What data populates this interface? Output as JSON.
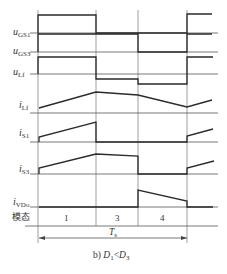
{
  "chart_data": {
    "type": "timing-diagram",
    "title": "",
    "caption": {
      "prefix": "b) ",
      "lhs": "D",
      "lhs_sub": "1",
      "op": "<",
      "rhs": "D",
      "rhs_sub": "3"
    },
    "period_label": {
      "main": "T",
      "sub": "s"
    },
    "mode_row": {
      "label": "模态",
      "modes": [
        "1",
        "3",
        "4"
      ]
    },
    "time_marks_px": [
      38,
      96,
      138,
      187
    ],
    "signals": [
      {
        "name": "u",
        "sub": "GS1",
        "baseline_y": 33,
        "label_y": 27,
        "points": [
          [
            38,
            33
          ],
          [
            38,
            15
          ],
          [
            96,
            15
          ],
          [
            96,
            33
          ],
          [
            187,
            33
          ],
          [
            187,
            14
          ],
          [
            212,
            14
          ]
        ]
      },
      {
        "name": "u",
        "sub": "GS3",
        "baseline_y": 52,
        "label_y": 46,
        "points": [
          [
            38,
            52
          ],
          [
            38,
            34
          ],
          [
            138,
            34
          ],
          [
            138,
            52
          ],
          [
            187,
            52
          ],
          [
            187,
            34
          ],
          [
            212,
            34
          ]
        ]
      },
      {
        "name": "u",
        "sub": "Lf",
        "baseline_y": 74,
        "label_y": 67,
        "points": [
          [
            38,
            74
          ],
          [
            38,
            57
          ],
          [
            96,
            57
          ],
          [
            96,
            79
          ],
          [
            138,
            79
          ],
          [
            138,
            84
          ],
          [
            187,
            84
          ],
          [
            187,
            57
          ],
          [
            213,
            57
          ]
        ]
      },
      {
        "name": "i",
        "sub": "Lf",
        "baseline_y": 113,
        "label_y": 100,
        "points": [
          [
            39,
            108
          ],
          [
            96,
            92
          ],
          [
            138,
            95
          ],
          [
            187,
            107
          ],
          [
            212,
            100
          ]
        ]
      },
      {
        "name": "i",
        "sub": "S1",
        "baseline_y": 142,
        "label_y": 128,
        "points": [
          [
            39,
            142
          ],
          [
            39,
            137
          ],
          [
            96,
            122
          ],
          [
            96,
            142
          ],
          [
            187,
            142
          ],
          [
            187,
            136
          ],
          [
            213,
            129
          ]
        ]
      },
      {
        "name": "i",
        "sub": "S3",
        "baseline_y": 174,
        "label_y": 164,
        "points": [
          [
            39,
            174
          ],
          [
            39,
            168
          ],
          [
            96,
            154
          ],
          [
            138,
            156
          ],
          [
            138,
            174
          ],
          [
            187,
            174
          ],
          [
            187,
            168
          ],
          [
            214,
            161
          ]
        ]
      },
      {
        "name": "i",
        "sub": "VDo",
        "baseline_y": 207,
        "label_y": 197,
        "points": [
          [
            39,
            207
          ],
          [
            138,
            207
          ],
          [
            138,
            190
          ],
          [
            187,
            201
          ],
          [
            187,
            207
          ],
          [
            213,
            207
          ]
        ]
      }
    ]
  }
}
